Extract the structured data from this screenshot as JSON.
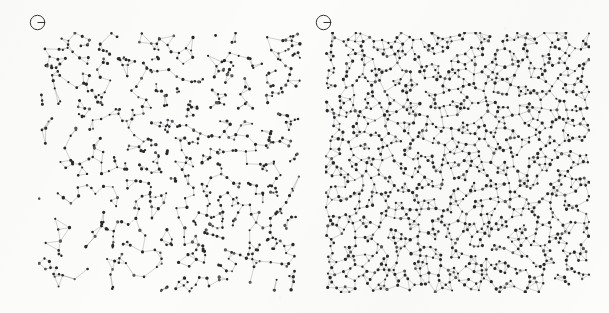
{
  "figure": {
    "background_color": "#fcfcfb",
    "width": 609,
    "height": 313,
    "panel_gap_px": 23
  },
  "style": {
    "point_color": "#2d2d2d",
    "point_color_light": "#5a5a5a",
    "edge_color": "#9a9a9a",
    "label_color": "#333333",
    "point_radius_px": 1.25,
    "edge_width_px": 0.45
  },
  "panels": [
    {
      "id": "panel-a",
      "label_glyph": "circle-with-bar",
      "label_name": "panel-label-a",
      "x": 38,
      "y": 32,
      "width": 264,
      "height": 261,
      "label_x": 28,
      "label_y": 13,
      "description": "clustered heterogeneous point pattern with large voids",
      "point_count": 700,
      "clustered": true,
      "void_scale": "large"
    },
    {
      "id": "panel-b",
      "label_glyph": "circle-with-bar",
      "label_name": "panel-label-b",
      "x": 325,
      "y": 32,
      "width": 265,
      "height": 261,
      "label_x": 314,
      "label_y": 13,
      "description": "denser near-uniform point pattern with small voids",
      "point_count": 1150,
      "clustered": false,
      "void_scale": "small"
    }
  ],
  "chart_data": {
    "type": "scatter",
    "title": "",
    "xlabel": "",
    "ylabel": "",
    "grid": false,
    "legend": null,
    "panel_count": 2,
    "series": [
      {
        "name": "panel-a-points",
        "panel": "panel-a",
        "n_points": 700,
        "spatial_structure": "clustered / aggregated",
        "connectivity": "nearest-neighbour graph edges",
        "xlim": [
          0,
          1
        ],
        "ylim": [
          0,
          1
        ]
      },
      {
        "name": "panel-b-points",
        "panel": "panel-b",
        "n_points": 1150,
        "spatial_structure": "homogeneous / near-random",
        "connectivity": "nearest-neighbour graph edges",
        "xlim": [
          0,
          1
        ],
        "ylim": [
          0,
          1
        ]
      }
    ]
  }
}
